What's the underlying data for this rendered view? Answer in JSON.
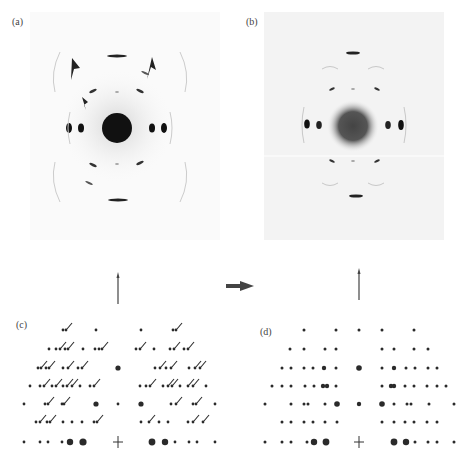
{
  "figure": {
    "panels": [
      {
        "id": "a",
        "label": "(a)",
        "type": "diffraction-photo",
        "annotations": "three arrowheads marking extra reflections"
      },
      {
        "id": "b",
        "label": "(b)",
        "type": "diffraction-photo"
      },
      {
        "id": "c",
        "label": "(c)",
        "type": "schematic-lattice",
        "note": "spots with tails (streaked reflections)"
      },
      {
        "id": "d",
        "label": "(d)",
        "type": "schematic-lattice",
        "note": "plain spots"
      }
    ],
    "arrow_between": "right-arrow",
    "colors": {
      "ink": "#333333",
      "photo_bg": "#f2f2f2",
      "spot": "#222222"
    }
  },
  "chart_data": {
    "type": "table",
    "title": ""
  }
}
